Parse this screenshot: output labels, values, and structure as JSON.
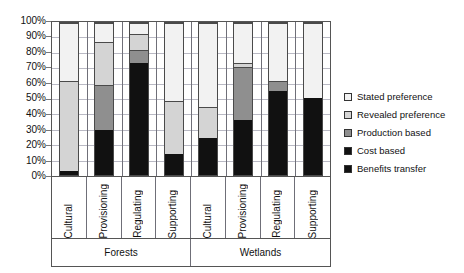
{
  "chart_data": {
    "type": "bar",
    "subtype": "stacked-percent",
    "title": "",
    "xlabel": "",
    "ylabel": "",
    "ylim": [
      0,
      100
    ],
    "yticks": [
      "0%",
      "10%",
      "20%",
      "30%",
      "40%",
      "50%",
      "60%",
      "70%",
      "80%",
      "90%",
      "100%"
    ],
    "grid": true,
    "legend_position": "right",
    "groups": [
      {
        "label": "Forests",
        "categories": [
          "Cultural",
          "Provisioning",
          "Regulating",
          "Supporting"
        ]
      },
      {
        "label": "Wetlands",
        "categories": [
          "Cultural",
          "Provisioning",
          "Regulating",
          "Supporting"
        ]
      }
    ],
    "categories": [
      "Cultural",
      "Provisioning",
      "Regulating",
      "Supporting",
      "Cultural",
      "Provisioning",
      "Regulating",
      "Supporting"
    ],
    "series": [
      {
        "name": "Benefits transfer",
        "key": "benefits",
        "color": "#111111",
        "values": [
          3,
          30,
          75,
          14,
          25,
          37,
          56,
          51
        ]
      },
      {
        "name": "Cost based",
        "key": "cost",
        "color": "#111111",
        "values": [
          0,
          0,
          0,
          0,
          0,
          0,
          0,
          0
        ]
      },
      {
        "name": "Production based",
        "key": "production",
        "color": "#8f8f8f",
        "values": [
          0,
          30,
          8,
          0,
          0,
          35,
          6,
          0
        ]
      },
      {
        "name": "Revealed preference",
        "key": "revealed",
        "color": "#d4d4d4",
        "values": [
          59,
          28,
          10,
          35,
          20,
          2,
          0,
          0
        ]
      },
      {
        "name": "Stated preference",
        "key": "stated",
        "color": "#f2f2f2",
        "values": [
          38,
          12,
          7,
          51,
          55,
          26,
          38,
          49
        ]
      }
    ]
  },
  "legend": {
    "items": [
      {
        "label": "Stated preference",
        "swatch": "legend-swatch-stated"
      },
      {
        "label": "Revealed preference",
        "swatch": "legend-swatch-revealed"
      },
      {
        "label": "Production based",
        "swatch": "legend-swatch-production"
      },
      {
        "label": "Cost based",
        "swatch": "legend-swatch-cost"
      },
      {
        "label": "Benefits transfer",
        "swatch": "legend-swatch-benefits"
      }
    ]
  }
}
